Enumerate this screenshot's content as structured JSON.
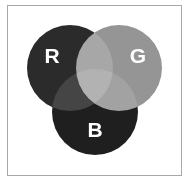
{
  "figure": {
    "background_color": "#ffffff",
    "frame": {
      "border_color": "#a8a8a8",
      "fill_color": "#ffffff",
      "x": 7,
      "y": 5,
      "width": 175,
      "height": 171
    }
  },
  "chart_data": {
    "type": "venn",
    "title": "",
    "xlabel": "",
    "ylabel": "",
    "grid": false,
    "legend_position": "none",
    "set_count": 3,
    "sets": [
      {
        "id": "R",
        "label": "R",
        "name": "red-channel",
        "color": "#2b2b2b",
        "label_color": "#ffffff",
        "cx": 70,
        "cy": 68,
        "r": 43,
        "label_x": 52,
        "label_y": 55
      },
      {
        "id": "G",
        "label": "G",
        "name": "green-channel",
        "color": "#959595",
        "label_color": "#ffffff",
        "cx": 119,
        "cy": 68,
        "r": 43,
        "label_x": 138,
        "label_y": 55
      },
      {
        "id": "B",
        "label": "B",
        "name": "blue-channel",
        "color": "#1f1f1f",
        "label_color": "#ffffff",
        "cx": 95,
        "cy": 112,
        "r": 43,
        "label_x": 95,
        "label_y": 129
      }
    ],
    "intersections": [
      {
        "id": "RG",
        "sets": [
          "R",
          "G"
        ],
        "mix_name": "yellow",
        "color": "#b5b5b5"
      },
      {
        "id": "GB",
        "sets": [
          "G",
          "B"
        ],
        "mix_name": "cyan",
        "color": "#828282"
      },
      {
        "id": "RB",
        "sets": [
          "R",
          "B"
        ],
        "mix_name": "magenta",
        "color": "#303030"
      },
      {
        "id": "RGB",
        "sets": [
          "R",
          "G",
          "B"
        ],
        "mix_name": "white",
        "color": "#fdfdfd"
      }
    ],
    "labels": [
      "R",
      "G",
      "B"
    ],
    "annotations": []
  }
}
